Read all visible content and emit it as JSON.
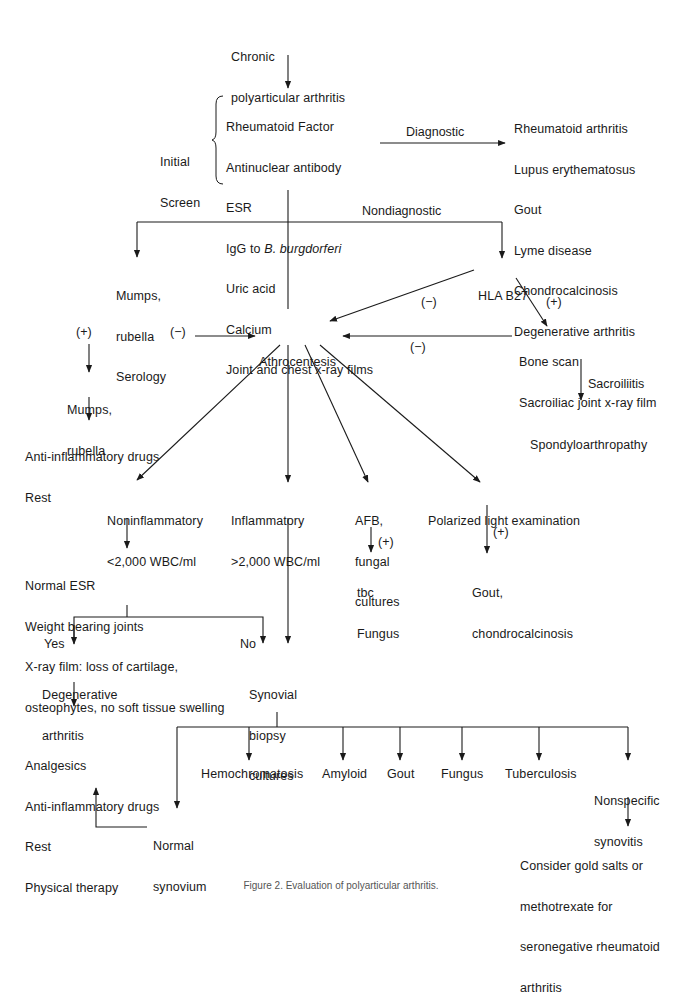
{
  "nodes": {
    "start": {
      "lines": [
        "Chronic",
        "polyarticular arthritis"
      ]
    },
    "initial_screen_label": {
      "lines": [
        "Initial",
        "Screen"
      ]
    },
    "initial_screen": {
      "lines": [
        "Rheumatoid Factor",
        "Antinuclear antibody",
        "ESR",
        "IgG to ",
        "Uric acid",
        "Calcium",
        "Joint and chest x-ray films"
      ],
      "italic_part": "B. burgdorferi"
    },
    "diagnostic_results": {
      "lines": [
        "Rheumatoid arthritis",
        "Lupus erythematosus",
        "Gout",
        "Lyme disease",
        "Chondrocalcinosis",
        "Degenerative arthritis"
      ]
    },
    "mumps_serology": {
      "lines": [
        "Mumps,",
        "rubella",
        "Serology"
      ]
    },
    "hla_b27": {
      "lines": [
        "HLA B27"
      ]
    },
    "athrocentesis": {
      "lines": [
        "Athrocentesis"
      ]
    },
    "bone_scan": {
      "lines": [
        "Bone scan",
        "Sacroiliac joint x-ray film"
      ]
    },
    "spondyloarthropathy": {
      "lines": [
        "Spondyloarthropathy"
      ]
    },
    "mumps_rubella": {
      "lines": [
        "Mumps,",
        "rubella"
      ]
    },
    "anti_inflammatory_rest": {
      "lines": [
        "Anti-inflammatory drugs",
        "Rest"
      ]
    },
    "noninflammatory": {
      "lines": [
        "Noninflammatory",
        "<2,000 WBC/ml"
      ]
    },
    "inflammatory": {
      "lines": [
        "Inflammatory",
        ">2,000 WBC/ml"
      ]
    },
    "afb_cultures": {
      "lines": [
        "AFB,",
        "fungal",
        "cultures"
      ]
    },
    "polarized_light": {
      "lines": [
        "Polarized light examination"
      ]
    },
    "tbc_fungus": {
      "lines": [
        "tbc",
        "Fungus"
      ]
    },
    "gout_chondro": {
      "lines": [
        "Gout,",
        "chondrocalcinosis"
      ]
    },
    "normal_esr": {
      "lines": [
        "Normal ESR",
        "Weight bearing joints",
        "X-ray film: loss of cartilage,",
        "osteophytes, no soft tissue swelling"
      ]
    },
    "degenerative": {
      "lines": [
        "Degenerative",
        "arthritis"
      ]
    },
    "synovial_biopsy": {
      "lines": [
        "Synovial",
        "biopsy",
        "cultures"
      ]
    },
    "treatment": {
      "lines": [
        "Analgesics",
        "Anti-inflammatory drugs",
        "Rest",
        "Physical therapy"
      ]
    },
    "normal_synovium": {
      "lines": [
        "Normal",
        "synovium"
      ]
    },
    "hemochromatosis": {
      "lines": [
        "Hemochromatosis"
      ]
    },
    "amyloid": {
      "lines": [
        "Amyloid"
      ]
    },
    "gout": {
      "lines": [
        "Gout"
      ]
    },
    "fungus": {
      "lines": [
        "Fungus"
      ]
    },
    "tuberculosis": {
      "lines": [
        "Tuberculosis"
      ]
    },
    "nonspecific": {
      "lines": [
        "Nonspecific",
        "synovitis"
      ]
    },
    "consider_gold": {
      "lines": [
        "Consider gold salts or",
        "methotrexate for",
        "seronegative rheumatoid",
        "arthritis"
      ]
    }
  },
  "edge_labels": {
    "diagnostic": "Diagnostic",
    "nondiagnostic": "Nondiagnostic",
    "hla_neg": "(−)",
    "hla_pos": "(+)",
    "bone_neg": "(−)",
    "serology_neg": "(−)",
    "serology_pos": "(+)",
    "sacroiliitis": "Sacroiliitis",
    "afb_pos": "(+)",
    "polarized_pos": "(+)",
    "yes": "Yes",
    "no": "No"
  },
  "caption": "Figure 2. Evaluation of polyarticular arthritis."
}
